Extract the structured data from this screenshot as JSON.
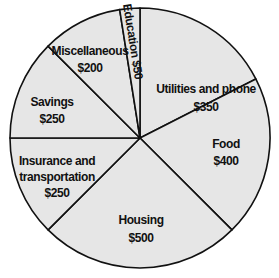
{
  "chart_data": {
    "type": "pie",
    "title": "",
    "start_angle_deg": 0,
    "direction": "clockwise",
    "total": 2000,
    "currency": "$",
    "slices": [
      {
        "label": "Utilities and phone",
        "value": 350,
        "display_value": "$350"
      },
      {
        "label": "Food",
        "value": 400,
        "display_value": "$400"
      },
      {
        "label": "Housing",
        "value": 500,
        "display_value": "$500"
      },
      {
        "label": "Insurance and transportation",
        "value": 250,
        "display_value": "$250"
      },
      {
        "label": "Savings",
        "value": 250,
        "display_value": "$250"
      },
      {
        "label": "Miscellaneous",
        "value": 200,
        "display_value": "$200"
      },
      {
        "label": "Education",
        "value": 50,
        "display_value": "$50"
      }
    ],
    "legend": "none",
    "labels_inside_slices": true
  },
  "colors": {
    "slice_fill": "#e6e6e6",
    "outline": "#111111",
    "text": "#111111",
    "background": "#ffffff"
  },
  "labels": {
    "utilities": {
      "line1": "Utilities and phone",
      "line2": "$350"
    },
    "food": {
      "line1": "Food",
      "line2": "$400"
    },
    "housing": {
      "line1": "Housing",
      "line2": "$500"
    },
    "insurance": {
      "line1": "Insurance and",
      "line2": "transportation",
      "line3": "$250"
    },
    "savings": {
      "line1": "Savings",
      "line2": "$250"
    },
    "misc": {
      "line1": "Miscellaneous",
      "line2": "$200"
    },
    "education": {
      "line1": "Education $50"
    }
  }
}
